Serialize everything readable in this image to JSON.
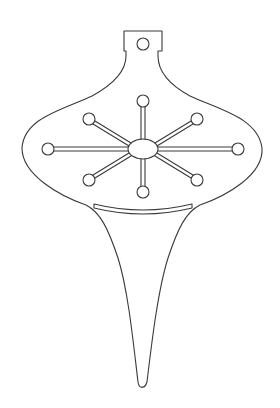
{
  "figure": {
    "title": "Ornament template",
    "description": "Line-art template of a Christmas ornament with a hanging cap, onion-shaped bulb with snowflake cut-out, curved slot, and long tapered tail.",
    "stroke_color": "#3a3a3a",
    "background_color": "#ffffff",
    "parts": {
      "cap": "hanging-cap",
      "cap_hole": "hanging-hole",
      "body": "ornament-body",
      "snowflake": "snowflake-cutout",
      "slot": "curved-slot",
      "tail": "tapered-tail"
    },
    "snowflake_arms": 8
  }
}
